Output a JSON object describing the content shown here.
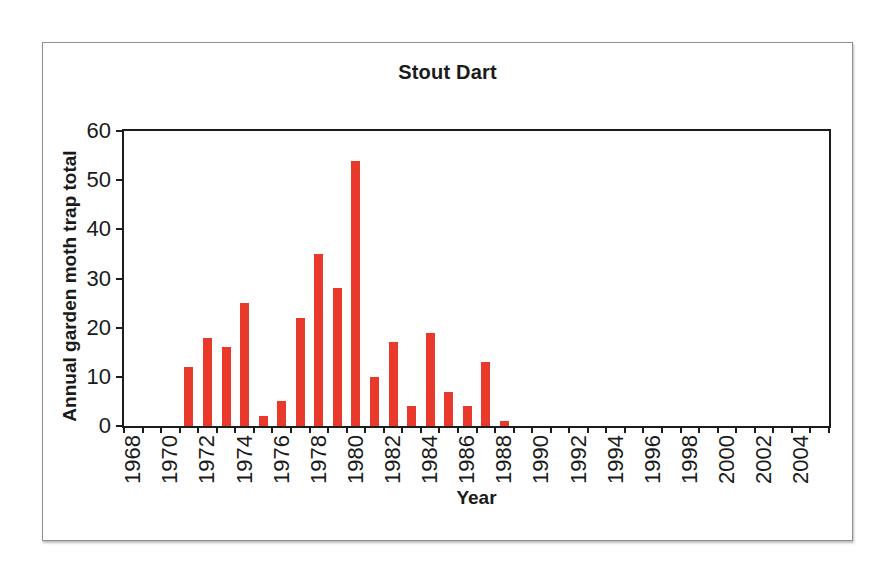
{
  "chart_data": {
    "type": "bar",
    "title": "Stout Dart",
    "xlabel": "Year",
    "ylabel": "Annual garden moth trap total",
    "ylim": [
      0,
      60
    ],
    "y_ticks": [
      0,
      10,
      20,
      30,
      40,
      50,
      60
    ],
    "x_range": [
      1968,
      2005
    ],
    "x_tick_labels": [
      1968,
      1970,
      1972,
      1974,
      1976,
      1978,
      1980,
      1982,
      1984,
      1986,
      1988,
      1990,
      1992,
      1994,
      1996,
      1998,
      2000,
      2002,
      2004
    ],
    "grid": false,
    "legend": "none",
    "bar_color": "#e8392b",
    "categories": [
      1971,
      1972,
      1973,
      1974,
      1975,
      1976,
      1977,
      1978,
      1979,
      1980,
      1981,
      1982,
      1983,
      1984,
      1985,
      1986,
      1987,
      1988
    ],
    "values": [
      12,
      18,
      16,
      25,
      2,
      5,
      22,
      35,
      28,
      54,
      10,
      17,
      4,
      19,
      7,
      4,
      13,
      1
    ]
  }
}
